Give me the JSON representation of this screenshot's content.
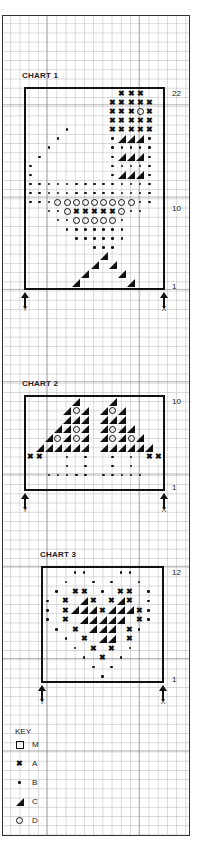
{
  "charts": [
    {
      "title": "CHART 1",
      "top_label": "22",
      "mid_label": "10",
      "bottom_label": "1",
      "arrow_left": "Y",
      "arrow_right": "X",
      "cols": 15,
      "rows": 22,
      "grid": [
        "..........AAA..",
        ".........AAAAA.",
        ".........AAADA.",
        ".........AAAAA.",
        "....B....AAAAA.",
        "...B.....BCCCB.",
        "..B......BBBBB.",
        ".B.......BCCCB.",
        "B........BBBBB.",
        "B........BCCCB.",
        "BBBBBBBBBBBBBB.",
        "BBBBBBBBBBBBBB.",
        "BBBDDDDDDDDDBB.",
        "..BBDAAAAADBB..",
        "...BBDDDDDB....",
        "....BBBBBBB....",
        ".....BBBBBB....",
        ".......BBB.....",
        "........C......",
        ".......C.C.....",
        "......C...C....",
        ".....C.....C..."
      ]
    },
    {
      "title": "CHART 2",
      "top_label": "10",
      "bottom_label": "1",
      "arrow_left": "Y",
      "arrow_right": "X",
      "cols": 15,
      "rows": 10,
      "grid": [
        ".....C...C.....",
        "....CDC.CDC....",
        "....CCC.CCC....",
        "...CCDC.CDCC...",
        "..CDCDC.CDCDC..",
        ".CCCCCC.CCCCCC.",
        "AA..B.B..B.B.AA",
        "....B.B..B.B...",
        "..BBBBB.BBBBB..",
        "..............."
      ]
    },
    {
      "title": "CHART 3",
      "top_label": "12",
      "bottom_label": "1",
      "arrow_left": "Y",
      "arrow_right": "X",
      "cols": 13,
      "rows": 12,
      "grid": [
        "...BB...BB...",
        "..B..B.B..B..",
        ".B.AA.B.AA.B.",
        "B.A.CA.ACA.B.",
        "B.ACCCACCCAB.",
        "B.A.CCCCC.AB.",
        ".B.A.CCC.AB..",
        "..B.A.CC.A...",
        "...B.A.A.B...",
        "....B.A.B....",
        ".....B.B.....",
        "......B......"
      ]
    }
  ],
  "key": {
    "title": "KEY",
    "items": [
      {
        "symbol": "M",
        "shape": "open-square",
        "label": "M"
      },
      {
        "symbol": "A",
        "shape": "cross",
        "label": "A"
      },
      {
        "symbol": "B",
        "shape": "dot",
        "label": "B"
      },
      {
        "symbol": "C",
        "shape": "half-triangle",
        "label": "C"
      },
      {
        "symbol": "D",
        "shape": "open-circle",
        "label": "D"
      }
    ]
  }
}
